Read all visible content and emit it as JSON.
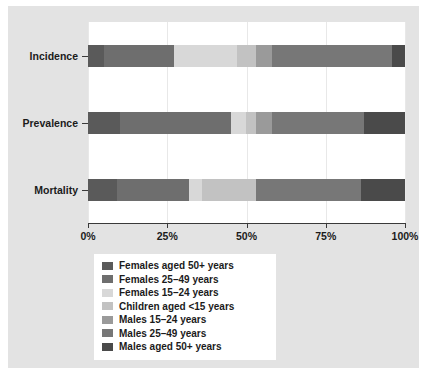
{
  "chart_data": {
    "type": "bar",
    "title": "",
    "subtitle": "",
    "xlabel": "",
    "ylabel": "",
    "orientation": "horizontal",
    "stacked": true,
    "normalized_percent": true,
    "grid": true,
    "legend_position": "bottom",
    "xlim": [
      0,
      100
    ],
    "categories": [
      "Incidence",
      "Prevalence",
      "Mortality"
    ],
    "xticklabels": [
      "0%",
      "25%",
      "50%",
      "75%",
      "100%"
    ],
    "xtickvalues": [
      0,
      25,
      50,
      75,
      100
    ],
    "series": [
      {
        "name": "Females aged 50+ years",
        "color": "#5a5a5a",
        "values": [
          5,
          10,
          9
        ]
      },
      {
        "name": "Females 25–49 years",
        "color": "#6e6e6e",
        "values": [
          22,
          35,
          23
        ]
      },
      {
        "name": "Females 15–24 years",
        "color": "#d8d8d8",
        "values": [
          20,
          5,
          4
        ]
      },
      {
        "name": "Children aged <15 years",
        "color": "#c2c2c2",
        "values": [
          6,
          3,
          17
        ]
      },
      {
        "name": "Males 15–24 years",
        "color": "#9a9a9a",
        "values": [
          5,
          5,
          0
        ]
      },
      {
        "name": "Males 25–49 years",
        "color": "#777777",
        "values": [
          38,
          29,
          33
        ]
      },
      {
        "name": "Males aged 50+ years",
        "color": "#4a4a4a",
        "values": [
          4,
          13,
          14
        ]
      }
    ]
  },
  "legend": {
    "items": [
      {
        "label": "Females aged 50+ years",
        "color": "#5a5a5a"
      },
      {
        "label": "Females 25–49 years",
        "color": "#6e6e6e"
      },
      {
        "label": "Females 15–24 years",
        "color": "#d8d8d8"
      },
      {
        "label": "Children aged <15 years",
        "color": "#c2c2c2"
      },
      {
        "label": "Males 15–24 years",
        "color": "#9a9a9a"
      },
      {
        "label": "Males 25–49 years",
        "color": "#777777"
      },
      {
        "label": "Males aged 50+ years",
        "color": "#4a4a4a"
      }
    ]
  },
  "style": {
    "figure_background": "#e3e3e3",
    "panel_background": "#ffffff",
    "axis_color": "#3a3a3a",
    "grid_color": "#e8e8e8",
    "text_color": "#1b1b1b"
  }
}
